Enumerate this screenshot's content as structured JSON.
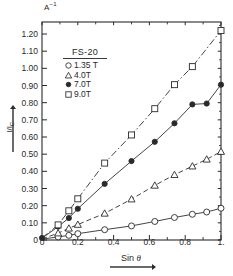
{
  "chart_data": {
    "type": "scatter",
    "title": "",
    "xlabel": "Sin θ",
    "ylabel": "I/I_C",
    "yunit": "A⁻¹",
    "xlim": [
      0,
      1.0
    ],
    "ylim": [
      0,
      1.27
    ],
    "grid": false,
    "legend_position": "upper-left-inside",
    "legend_title": "FS-20",
    "x_ticks": [
      "0",
      "0.2",
      "0.4",
      "0.6",
      "0.8",
      "1."
    ],
    "x_tick_values": [
      0,
      0.2,
      0.4,
      0.6,
      0.8,
      1.0
    ],
    "y_ticks": [
      "0",
      "0.10",
      "0.20",
      "0.30",
      "0.40",
      "0.50",
      "0.60",
      "0.70",
      "0.80",
      "0.90",
      "1.00",
      "1.10",
      "1.20"
    ],
    "y_tick_values": [
      0,
      0.1,
      0.2,
      0.3,
      0.4,
      0.5,
      0.6,
      0.7,
      0.8,
      0.9,
      1.0,
      1.1,
      1.2
    ],
    "series": [
      {
        "name": "1.35 T",
        "marker": "open-circle",
        "line": "solid",
        "x": [
          0.0,
          0.09,
          0.15,
          0.2,
          0.35,
          0.5,
          0.63,
          0.74,
          0.84,
          0.92,
          1.0
        ],
        "values": [
          0.005,
          0.018,
          0.027,
          0.037,
          0.06,
          0.082,
          0.108,
          0.131,
          0.15,
          0.163,
          0.185
        ]
      },
      {
        "name": "4.0T",
        "marker": "open-triangle",
        "line": "dashed",
        "x": [
          0.0,
          0.09,
          0.15,
          0.2,
          0.35,
          0.5,
          0.63,
          0.74,
          0.84,
          0.92,
          1.0
        ],
        "values": [
          0.006,
          0.04,
          0.068,
          0.09,
          0.155,
          0.238,
          0.318,
          0.38,
          0.43,
          0.47,
          0.515
        ]
      },
      {
        "name": "7.0T",
        "marker": "filled-circle",
        "line": "solid",
        "x": [
          0.0,
          0.09,
          0.15,
          0.2,
          0.35,
          0.5,
          0.63,
          0.74,
          0.84,
          0.92,
          1.0
        ],
        "values": [
          0.01,
          0.078,
          0.128,
          0.182,
          0.327,
          0.46,
          0.572,
          0.68,
          0.79,
          0.795,
          0.905
        ]
      },
      {
        "name": "9.0T",
        "marker": "open-square",
        "line": "dash-dot",
        "x": [
          0.0,
          0.09,
          0.15,
          0.2,
          0.35,
          0.5,
          0.63,
          0.74,
          0.84,
          1.0
        ],
        "values": [
          0.012,
          0.088,
          0.17,
          0.24,
          0.448,
          0.612,
          0.765,
          0.905,
          1.01,
          1.22
        ]
      }
    ]
  },
  "legend": {
    "title": "FS-20",
    "entries": [
      {
        "label": "1.35 T",
        "marker": "open-circle"
      },
      {
        "label": "4.0T",
        "marker": "open-triangle"
      },
      {
        "label": "7.0T",
        "marker": "filled-circle"
      },
      {
        "label": "9.0T",
        "marker": "open-square"
      }
    ]
  },
  "axes": {
    "y_unit_label": "A",
    "y_unit_exponent": "−1",
    "y_axis_title_main": "I/I",
    "y_axis_title_sub": "C",
    "x_axis_title_prefix": "Sin ",
    "x_axis_title_symbol": "θ"
  },
  "colors": {
    "axis": "#2a2a2a",
    "marker": "#2a2a2a",
    "line": "#3a3a3a",
    "background": "#ffffff"
  }
}
